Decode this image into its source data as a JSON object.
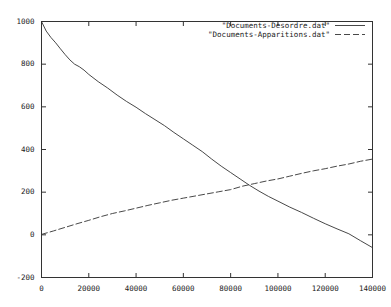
{
  "chart_data": {
    "type": "line",
    "title": "",
    "xlabel": "",
    "ylabel": "",
    "xlim": [
      0,
      140000
    ],
    "ylim": [
      -200,
      1000
    ],
    "grid": false,
    "legend_position": "top-right",
    "xticks": [
      "0",
      "20000",
      "40000",
      "60000",
      "80000",
      "100000",
      "120000",
      "140000"
    ],
    "xtick_values": [
      0,
      20000,
      40000,
      60000,
      80000,
      100000,
      120000,
      140000
    ],
    "yticks": [
      "-200",
      "0",
      "200",
      "400",
      "600",
      "800",
      "1000"
    ],
    "ytick_values": [
      -200,
      0,
      200,
      400,
      600,
      800,
      1000
    ],
    "series": [
      {
        "name": "\"Documents-Desordre.dat\"",
        "style": "solid",
        "color": "#333333",
        "x": [
          0,
          2000,
          4000,
          6000,
          8000,
          10000,
          12000,
          14000,
          16000,
          18000,
          20000,
          24000,
          28000,
          32000,
          36000,
          40000,
          44000,
          48000,
          52000,
          56000,
          60000,
          64000,
          68000,
          72000,
          76000,
          80000,
          84000,
          88000,
          92000,
          96000,
          100000,
          105000,
          110000,
          115000,
          120000,
          125000,
          130000,
          135000,
          140000
        ],
        "y": [
          1000,
          955,
          925,
          900,
          872,
          845,
          820,
          800,
          788,
          772,
          752,
          718,
          688,
          655,
          625,
          598,
          568,
          540,
          512,
          480,
          450,
          420,
          390,
          355,
          322,
          292,
          262,
          232,
          205,
          180,
          158,
          130,
          105,
          78,
          52,
          28,
          5,
          -28,
          -60
        ]
      },
      {
        "name": "\"Documents-Apparitions.dat\"",
        "style": "dashed",
        "color": "#333333",
        "x": [
          0,
          5000,
          10000,
          15000,
          20000,
          25000,
          30000,
          35000,
          40000,
          45000,
          50000,
          55000,
          60000,
          65000,
          70000,
          75000,
          80000,
          85000,
          90000,
          95000,
          100000,
          105000,
          110000,
          115000,
          120000,
          125000,
          130000,
          135000,
          140000
        ],
        "y": [
          2,
          18,
          35,
          52,
          68,
          85,
          100,
          112,
          125,
          138,
          150,
          162,
          172,
          182,
          192,
          202,
          212,
          228,
          240,
          252,
          262,
          275,
          288,
          300,
          310,
          322,
          332,
          345,
          355
        ]
      }
    ]
  },
  "legend": {
    "entries": [
      {
        "label": "\"Documents-Desordre.dat\"",
        "style": "solid"
      },
      {
        "label": "\"Documents-Apparitions.dat\"",
        "style": "dashed"
      }
    ]
  },
  "axes": {
    "frame_color": "#333333"
  }
}
